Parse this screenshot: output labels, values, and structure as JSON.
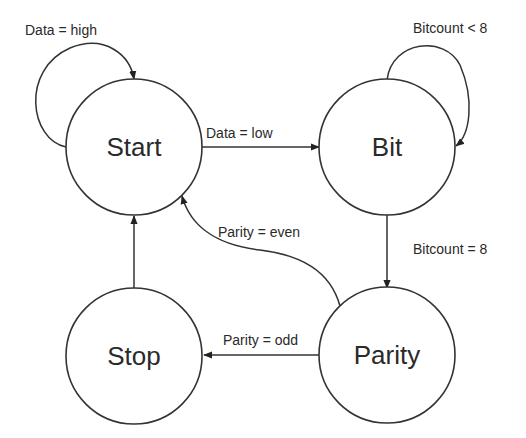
{
  "diagram": {
    "type": "state-machine",
    "colors": {
      "stroke": "#333333",
      "text": "#2a2a2a",
      "background": "#ffffff"
    },
    "states": [
      {
        "id": "start",
        "label": "Start"
      },
      {
        "id": "bit",
        "label": "Bit"
      },
      {
        "id": "stop",
        "label": "Stop"
      },
      {
        "id": "parity",
        "label": "Parity"
      }
    ],
    "transitions": [
      {
        "from": "start",
        "to": "start",
        "label": "Data = high"
      },
      {
        "from": "start",
        "to": "bit",
        "label": "Data = low"
      },
      {
        "from": "bit",
        "to": "bit",
        "label": "Bitcount < 8"
      },
      {
        "from": "bit",
        "to": "parity",
        "label": "Bitcount = 8"
      },
      {
        "from": "parity",
        "to": "start",
        "label": "Parity = even"
      },
      {
        "from": "parity",
        "to": "stop",
        "label": "Parity = odd"
      },
      {
        "from": "stop",
        "to": "start",
        "label": ""
      }
    ]
  }
}
